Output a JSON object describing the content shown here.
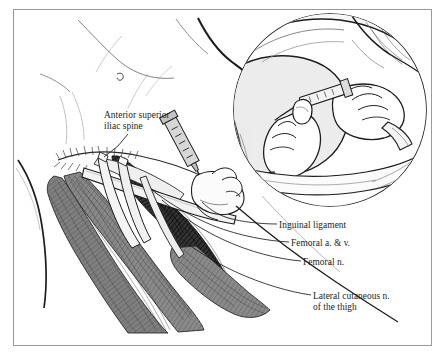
{
  "figure": {
    "border_color": "#9a9a9a",
    "background_color": "#ffffff",
    "ink_color": "#231f20"
  },
  "labels": [
    {
      "id": "anterior-superior-iliac-spine",
      "text": "Anterior superior\niliac spine",
      "lines": [
        "Anterior superior",
        "iliac spine"
      ]
    },
    {
      "id": "inguinal-ligament",
      "text": "Inguinal ligament",
      "lines": [
        "Inguinal ligament"
      ]
    },
    {
      "id": "femoral-artery-and-vein",
      "text": "Femoral a. & v.",
      "lines": [
        "Femoral a. & v."
      ]
    },
    {
      "id": "femoral-nerve",
      "text": "Femoral n.",
      "lines": [
        "Femoral n."
      ]
    },
    {
      "id": "lateral-cutaneous-nerve-of-the-thigh",
      "text": "Lateral cutaneous n.\nof the thigh",
      "lines": [
        "Lateral cutaneous n.",
        "of the thigh"
      ]
    }
  ],
  "label_text": {
    "asis_line1": "Anterior superior",
    "asis_line2": "iliac spine",
    "inguinal_ligament": "Inguinal ligament",
    "femoral_av": "Femoral a. & v.",
    "femoral_n": "Femoral n.",
    "lat_cut_line1": "Lateral cutaneous n.",
    "lat_cut_line2": "of the thigh"
  },
  "inset": {
    "shape": "circle",
    "center_x": 330,
    "center_y": 110,
    "radius": 97,
    "content": "Gloved hands palpating the femoral pulse while a syringe and needle are advanced into the groin; draped patient leg below."
  },
  "palette": {
    "muscle_mid": "#8a8a8a",
    "muscle_dark": "#2b2b2b",
    "muscle_light": "#c9c9c9",
    "skin_tone": "#e9e9e9",
    "outline": "#231f20",
    "frame": "#9a9a9a"
  }
}
